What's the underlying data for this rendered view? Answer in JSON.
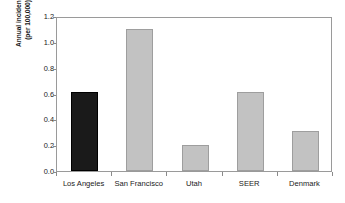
{
  "chart_data": {
    "type": "bar",
    "title": "",
    "subtitle": "",
    "xlabel": "",
    "ylabel": "Annual incidence (per 100,000)",
    "ylabel_line1": "Annual incidence",
    "ylabel_line2": "(per 100,000)",
    "categories": [
      "Los Angeles",
      "San Francisco",
      "Utah",
      "SEER",
      "Denmark"
    ],
    "values": [
      0.61,
      1.1,
      0.2,
      0.61,
      0.31
    ],
    "ylim": [
      0.0,
      1.2
    ],
    "ytick_values": [
      0.0,
      0.2,
      0.4,
      0.6,
      0.8,
      1.0,
      1.2
    ],
    "ytick_labels": [
      "0.0",
      "0.2",
      "0.4",
      "0.6",
      "0.8",
      "1.0",
      "1.2"
    ],
    "grid": false,
    "legend": false,
    "legend_position": "none",
    "bar_colors": [
      "#1a1a1a",
      "#c2c2c2",
      "#c2c2c2",
      "#c2c2c2",
      "#c2c2c2"
    ],
    "highlight_category": "Los Angeles",
    "frame": "full-box",
    "axis_color": "#9a9a9a",
    "text_color": "#1a1a1a"
  }
}
